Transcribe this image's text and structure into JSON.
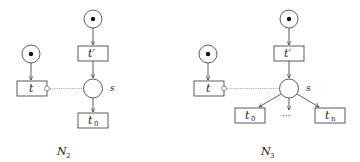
{
  "diagrams": [
    {
      "name": "N2",
      "caption": "N",
      "caption_sub": "2",
      "transitions": {
        "t": "t",
        "t_prime": "t′",
        "t0": "t",
        "t0_sub": "0"
      },
      "place_label": "s"
    },
    {
      "name": "N3",
      "caption": "N",
      "caption_sub": "3",
      "transitions": {
        "t": "t",
        "t_prime": "t′",
        "t0": "t",
        "t0_sub": "0",
        "tn": "t",
        "tn_sub": "n",
        "ellipsis": "···"
      },
      "place_label": "s"
    }
  ],
  "colors": {
    "stroke": "#333333",
    "inhibitor": "#777777"
  }
}
